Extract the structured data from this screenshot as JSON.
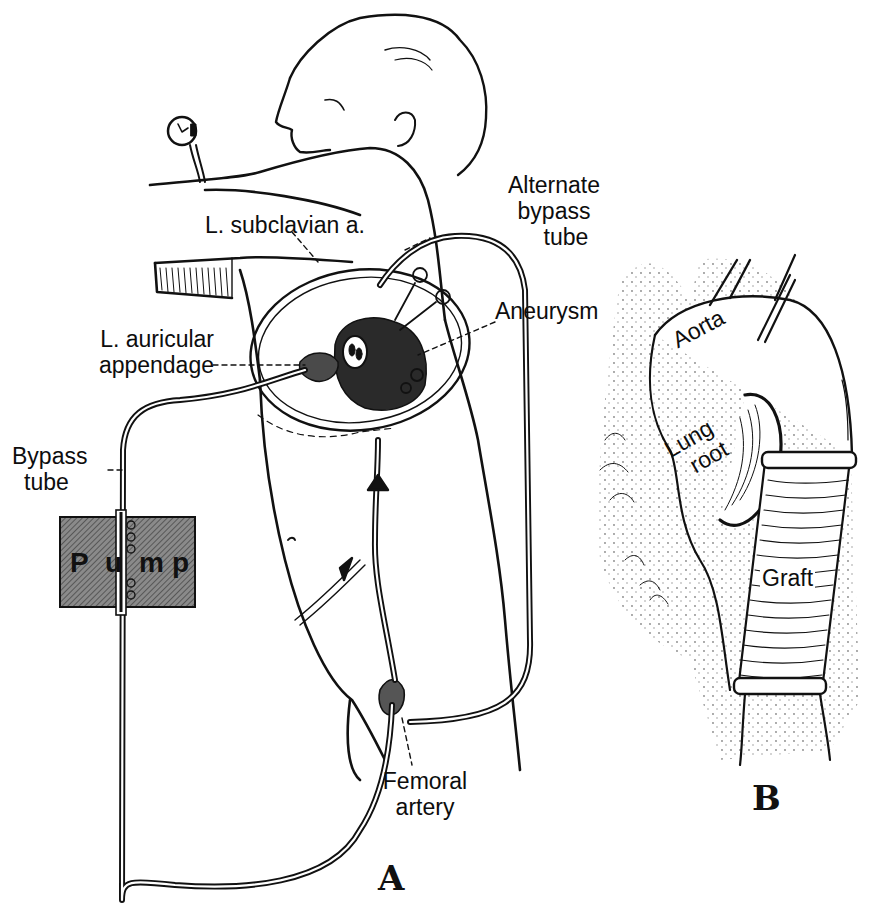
{
  "figure": {
    "panels": [
      {
        "id": "A",
        "letter": "A",
        "description": "Patient lying on side with open left thoracotomy; bypass circuit from left auricular appendage through pump to femoral artery"
      },
      {
        "id": "B",
        "letter": "B",
        "description": "Close-up of descending aorta replaced with ribbed graft beside the lung root"
      }
    ],
    "labels_panel_a": {
      "subclavian": "L. subclavian a.",
      "alternate_bypass": [
        "Alternate",
        "bypass",
        "tube"
      ],
      "aneurysm": "Aneurysm",
      "auricular": [
        "L. auricular",
        "appendage"
      ],
      "bypass_tube": [
        "Bypass",
        "tube"
      ],
      "pump": [
        "P",
        "u",
        "m",
        "p"
      ],
      "femoral": [
        "Femoral",
        "artery"
      ]
    },
    "labels_panel_b": {
      "aorta": "Aorta",
      "lung_root": [
        "Lung",
        "root"
      ],
      "graft": "Graft"
    },
    "colors": {
      "ink": "#111111",
      "pump_fill": "#7a7a7a",
      "background": "#ffffff"
    }
  }
}
